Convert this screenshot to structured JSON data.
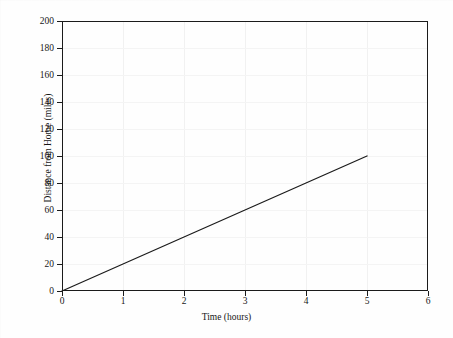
{
  "figure": {
    "background_color": "#fefefe",
    "frame_color": "#1b1b1b",
    "grid_color": "#f1f1f1"
  },
  "chart_data": {
    "type": "line",
    "title": "",
    "xlabel": "Time (hours)",
    "ylabel": "Distance from Home (miles)",
    "xlim": [
      0,
      6
    ],
    "ylim": [
      0,
      200
    ],
    "xticks": [
      0,
      1,
      2,
      3,
      4,
      5,
      6
    ],
    "xticklabels": [
      "0",
      "1",
      "2",
      "3",
      "4",
      "5",
      "6"
    ],
    "yticks": [
      0,
      20,
      40,
      60,
      80,
      100,
      120,
      140,
      160,
      180,
      200
    ],
    "yticklabels": [
      "0",
      "20",
      "40",
      "60",
      "80",
      "100",
      "120",
      "140",
      "160",
      "180",
      "200"
    ],
    "grid": true,
    "legend": false,
    "series": [
      {
        "name": "Distance traveled",
        "color": "#1b1b1b",
        "linewidth": 1.2,
        "x": [
          0,
          5
        ],
        "y": [
          0,
          100
        ],
        "slope_miles_per_hour": 20,
        "points": [
          {
            "x": 0,
            "y": 0
          },
          {
            "x": 1,
            "y": 20
          },
          {
            "x": 2,
            "y": 40
          },
          {
            "x": 3,
            "y": 60
          },
          {
            "x": 4,
            "y": 80
          },
          {
            "x": 5,
            "y": 100
          }
        ]
      }
    ]
  }
}
